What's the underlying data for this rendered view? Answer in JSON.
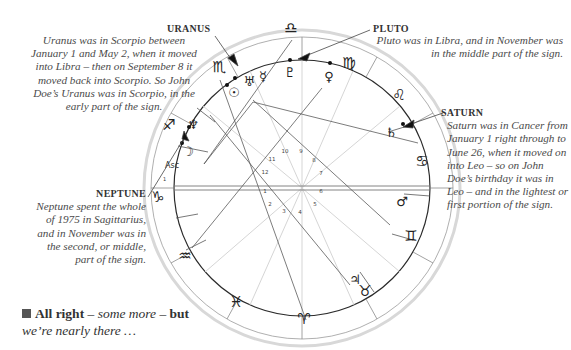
{
  "notes": {
    "uranus": {
      "title": "URANUS",
      "body": "Uranus was in Scorpio between January 1 and May 2, when it moved into Libra – then on September 8 it moved back into Scorpio. So John Doe’s Uranus was in Scorpio, in the early part of the sign."
    },
    "pluto": {
      "title": "PLUTO",
      "body": "Pluto was in Libra, and in November was in the middle part of the sign."
    },
    "saturn": {
      "title": "SATURN",
      "body": "Saturn was in Cancer from January 1 right through to June 26, when it moved on into Leo – so on John Doe’s birthday it was in Leo – and in the lightest or first portion of the sign."
    },
    "neptune": {
      "title": "NEPTUNE",
      "body": "Neptune spent the whole of 1975 in Sagittarius, and in November was in the second, or middle, part of the sign."
    }
  },
  "footer": {
    "bold": "All right",
    "dash1": " – ",
    "italic1": "some more",
    "dash2": " – ",
    "bold2": "but",
    "italic2": "we’re nearly there …"
  },
  "chart": {
    "ascendant_label": "Asc",
    "zodiac_signs": [
      {
        "name": "libra",
        "glyph": "♎"
      },
      {
        "name": "virgo",
        "glyph": "♍"
      },
      {
        "name": "leo",
        "glyph": "♌"
      },
      {
        "name": "cancer",
        "glyph": "♋"
      },
      {
        "name": "gemini",
        "glyph": "♊"
      },
      {
        "name": "taurus",
        "glyph": "♉"
      },
      {
        "name": "aries",
        "glyph": "♈"
      },
      {
        "name": "pisces",
        "glyph": "♓"
      },
      {
        "name": "aquarius",
        "glyph": "♒"
      },
      {
        "name": "capricorn",
        "glyph": "♑"
      },
      {
        "name": "sagittarius",
        "glyph": "♐"
      },
      {
        "name": "scorpio",
        "glyph": "♏"
      }
    ],
    "planets": [
      {
        "name": "pluto",
        "glyph": "♇"
      },
      {
        "name": "venus",
        "glyph": "♀"
      },
      {
        "name": "mercury",
        "glyph": "☿"
      },
      {
        "name": "uranus",
        "glyph": "♅"
      },
      {
        "name": "sun",
        "glyph": "☉"
      },
      {
        "name": "neptune",
        "glyph": "♆"
      },
      {
        "name": "moon",
        "glyph": "☽"
      },
      {
        "name": "saturn",
        "glyph": "♄"
      },
      {
        "name": "mars",
        "glyph": "♂"
      },
      {
        "name": "jupiter",
        "glyph": "♃"
      }
    ],
    "house_numbers": [
      "1",
      "2",
      "3",
      "4",
      "5",
      "6",
      "7",
      "8",
      "9",
      "10",
      "11",
      "12"
    ],
    "small_labels": {
      "asc_one": "1"
    }
  }
}
